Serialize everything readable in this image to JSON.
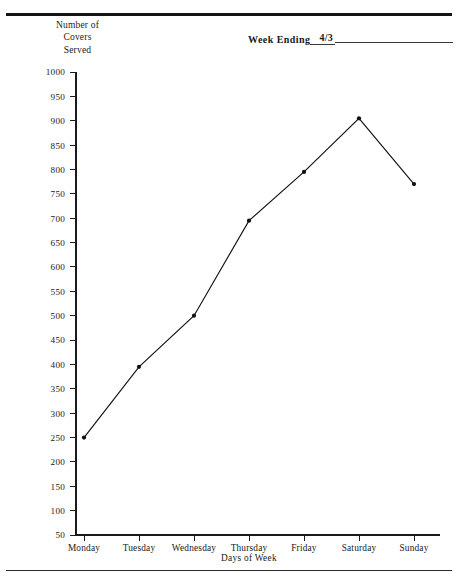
{
  "form": {
    "week_ending_label": "Week Ending",
    "week_ending_value": "4/3"
  },
  "y_axis_title_lines": {
    "line1": "Number of",
    "line2": "Covers",
    "line3": "Served"
  },
  "chart_data": {
    "type": "line",
    "title": "",
    "xlabel": "Days of Week",
    "ylabel": "Number of Covers Served",
    "categories": [
      "Monday",
      "Tuesday",
      "Wednesday",
      "Thursday",
      "Friday",
      "Saturday",
      "Sunday"
    ],
    "values": [
      250,
      395,
      500,
      695,
      795,
      905,
      770
    ],
    "ylim": [
      50,
      1000
    ],
    "ytick_step": 50,
    "yticks": [
      1000,
      950,
      900,
      850,
      800,
      750,
      700,
      650,
      600,
      550,
      500,
      450,
      400,
      350,
      300,
      250,
      200,
      150,
      100,
      50
    ],
    "ytick_labels": [
      "1000",
      "950",
      "900",
      "850",
      "800",
      "750",
      "700",
      "650",
      "600",
      "550",
      "500",
      "450",
      "400",
      "350",
      "300",
      "250",
      "200",
      "150",
      "100",
      "50"
    ],
    "grid": false,
    "legend": false,
    "markers": true,
    "line_color": "#111111",
    "marker_color": "#111111"
  }
}
